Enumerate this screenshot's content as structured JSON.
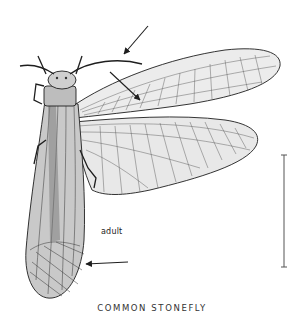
{
  "figure": {
    "caption": "COMMON STONEFLY",
    "stage_label": "adult",
    "colors": {
      "ink": "#1e1e1e",
      "wing_fill": "#e9e9e9",
      "body_fill": "#9a9a9a",
      "background": "#ffffff"
    },
    "annotations": [
      {
        "name": "antenna-arrow",
        "points_to": "antenna"
      },
      {
        "name": "wing-vein-arrow",
        "points_to": "forewing crossveins"
      },
      {
        "name": "wing-tip-arrow",
        "points_to": "folded wing tip"
      }
    ],
    "scale_bar": {
      "orientation": "vertical"
    }
  }
}
